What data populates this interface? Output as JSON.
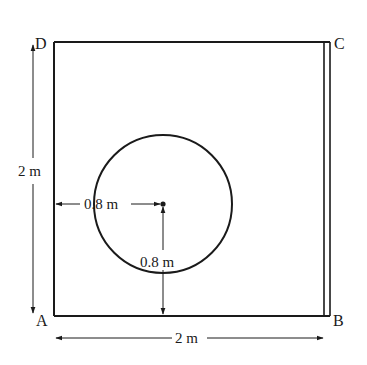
{
  "diagram": {
    "corners": {
      "A": "A",
      "B": "B",
      "C": "C",
      "D": "D"
    },
    "dimensions": {
      "side_vertical": "2 m",
      "side_horizontal": "2 m",
      "circle_from_left": "0.8 m",
      "circle_from_bottom": "0.8 m"
    },
    "colors": {
      "line": "#1a1a1a",
      "background": "#ffffff"
    }
  }
}
